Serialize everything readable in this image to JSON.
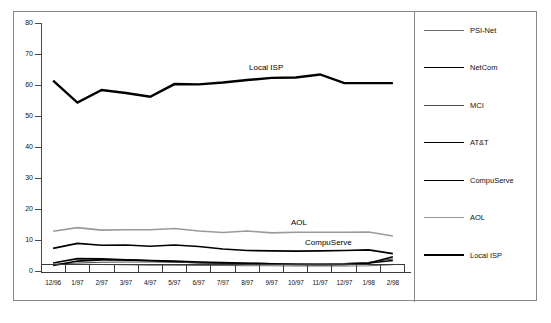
{
  "chart_data": {
    "type": "line",
    "title": "",
    "xlabel": "",
    "ylabel": "",
    "ylim": [
      0,
      80
    ],
    "ytick_step": 10,
    "yticks": [
      "0",
      "10",
      "20",
      "30",
      "40",
      "50",
      "60",
      "70",
      "80"
    ],
    "grid": false,
    "legend_position": "right",
    "categories": [
      "12/96",
      "1/97",
      "2/97",
      "3/97",
      "4/97",
      "5/97",
      "6/97",
      "7/97",
      "8/97",
      "9/97",
      "10/97",
      "11/97",
      "12/97",
      "1/98",
      "2/98"
    ],
    "series": [
      {
        "name": "PSI-Net",
        "color": "#6b6b6b",
        "width": 1.1,
        "values": [
          2.0,
          2.2,
          2.1,
          2.0,
          1.9,
          1.9,
          1.8,
          1.8,
          1.7,
          1.7,
          1.6,
          1.6,
          1.6,
          1.7,
          2.0
        ]
      },
      {
        "name": "NetCom",
        "color": "#000000",
        "width": 1.6,
        "values": [
          2.6,
          4.0,
          3.9,
          3.6,
          3.3,
          3.0,
          2.7,
          2.5,
          2.4,
          2.3,
          2.2,
          2.2,
          2.3,
          2.6,
          3.4
        ]
      },
      {
        "name": "MCI",
        "color": "#4d4d4d",
        "width": 1.1,
        "values": [
          2.2,
          2.6,
          2.8,
          2.9,
          2.9,
          2.8,
          2.7,
          2.6,
          2.5,
          2.4,
          2.3,
          2.3,
          2.4,
          2.8,
          3.9
        ]
      },
      {
        "name": "AT&T",
        "color": "#000000",
        "width": 1.6,
        "values": [
          1.8,
          3.2,
          3.6,
          3.6,
          3.4,
          3.2,
          2.9,
          2.7,
          2.5,
          2.3,
          2.1,
          2.0,
          2.1,
          2.5,
          4.6
        ]
      },
      {
        "name": "CompuServe",
        "color": "#000000",
        "width": 1.6,
        "values": [
          7.3,
          8.9,
          8.3,
          8.4,
          8.0,
          8.4,
          7.9,
          7.1,
          6.6,
          6.5,
          6.4,
          6.5,
          6.6,
          6.8,
          5.6
        ]
      },
      {
        "name": "AOL",
        "color": "#9a9a9a",
        "width": 1.6,
        "values": [
          12.8,
          14.0,
          13.2,
          13.3,
          13.3,
          13.7,
          12.9,
          12.4,
          12.9,
          12.3,
          12.5,
          12.5,
          12.5,
          12.6,
          11.3
        ]
      },
      {
        "name": "Local ISP",
        "color": "#000000",
        "width": 2.4,
        "values": [
          61.4,
          54.3,
          58.4,
          57.4,
          56.2,
          60.3,
          60.2,
          60.8,
          61.6,
          62.3,
          62.4,
          63.4,
          60.6,
          60.6,
          60.6
        ]
      }
    ],
    "annotations": [
      {
        "text": "Local ISP",
        "series": "Local ISP"
      },
      {
        "text": "AOL",
        "series": "AOL"
      },
      {
        "text": "CompuServe",
        "series": "CompuServe"
      }
    ]
  },
  "legend": {
    "entries": [
      {
        "label": "PSI-Net"
      },
      {
        "label": "NetCom"
      },
      {
        "label": "MCI"
      },
      {
        "label": "AT&T"
      },
      {
        "label": "CompuServe"
      },
      {
        "label": "AOL"
      },
      {
        "label": "Local ISP"
      }
    ]
  },
  "colors": {
    "frame": "#8a8a8a",
    "axis": "#3a3a3a",
    "background": "#ffffff",
    "text": "#111111"
  }
}
